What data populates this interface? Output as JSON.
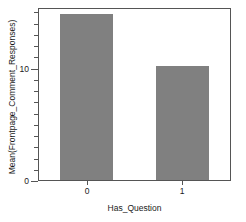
{
  "chart_data": {
    "type": "bar",
    "title": "",
    "subtitle": "",
    "xlabel": "Has_Question",
    "ylabel": "Mean(Frontpage_Comment_Responses)",
    "categories": [
      "0",
      "1"
    ],
    "values": [
      14.8,
      10.1
    ],
    "series": [
      {
        "name": "Mean(Frontpage_Comment_Responses)",
        "values": [
          14.8,
          10.1
        ]
      }
    ],
    "ylim": [
      0,
      15.3
    ],
    "xlim": [
      0,
      2
    ],
    "y_tick_labels": [
      "0",
      "10"
    ],
    "y_tick_values": [
      0,
      10
    ],
    "y_minor_tick_values": [
      1,
      2,
      3,
      4,
      5,
      6,
      7,
      8,
      9,
      11,
      12,
      13,
      14,
      15
    ],
    "x_tick_labels": [
      "0",
      "1"
    ],
    "grid": false,
    "legend": false,
    "legend_position": "none",
    "bar_color": "#808080",
    "axis_color": "#555555",
    "text_color": "#1a1a1a",
    "background_color": "#ffffff"
  }
}
